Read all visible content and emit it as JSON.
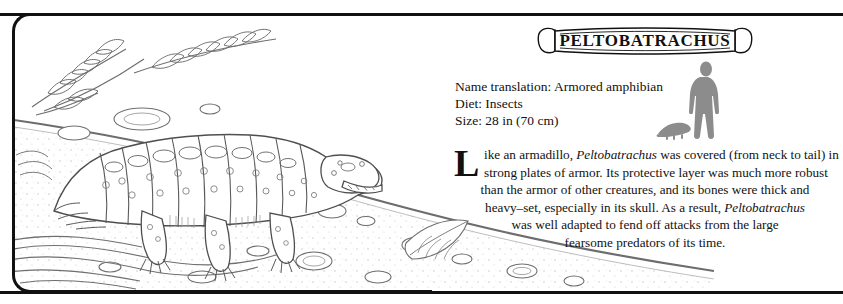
{
  "entry": {
    "title": "PELTOBATRACHUS",
    "facts": [
      "Name translation: Armored amphibian",
      "Diet: Insects",
      "Size: 28 in (70 cm)"
    ],
    "dropcap": "L",
    "body_lines": [
      "ike an armadillo, Peltobatrachus was covered (from neck to tail) in",
      "strong plates of armor. Its protective layer was much more robust",
      "than the armor of other creatures, and its bones were thick and",
      "heavy–set, especially in its skull. As a result, Peltobatrachus",
      "was well adapted to fend off attacks from the large",
      "fearsome predators of its time."
    ],
    "species_name": "Peltobatrachus"
  },
  "scale": {
    "human_label": "human-silhouette",
    "animal_label": "peltobatrachus-silhouette",
    "color": "#8c8c8c"
  },
  "colors": {
    "ink": "#111111",
    "line": "#5a5a5a",
    "paper": "#ffffff",
    "silhouette": "#8c8c8c"
  },
  "illustration": {
    "subject": "peltobatrachus-line-drawing",
    "elements": [
      "fern-fronds",
      "ground-line",
      "pebbles",
      "fallen-leaf",
      "water-ripples"
    ]
  }
}
